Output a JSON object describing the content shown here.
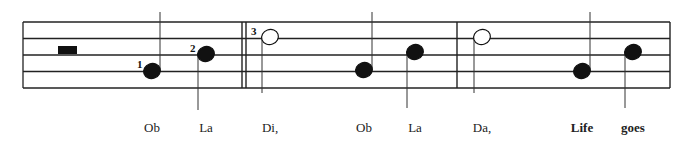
{
  "staff": {
    "lines": 5,
    "top": 22,
    "spacing": 16.5,
    "left": 23,
    "right": 670
  },
  "barlines": [
    {
      "x": 242,
      "double": true
    },
    {
      "x": 457,
      "double": false
    },
    {
      "x": 670,
      "double": false
    }
  ],
  "rest": {
    "type": "half-rest",
    "x": 58,
    "y": 46
  },
  "notes": [
    {
      "x": 152,
      "y": 71,
      "filled": true,
      "stem": "up",
      "marker": "1",
      "lyric": "Ob"
    },
    {
      "x": 206,
      "y": 54,
      "filled": true,
      "stem": "down",
      "marker": "2",
      "lyric": "La"
    },
    {
      "x": 270,
      "y": 37,
      "filled": false,
      "stem": "down",
      "marker": "3",
      "lyric": "Di,"
    },
    {
      "x": 364,
      "y": 70,
      "filled": true,
      "stem": "up",
      "lyric": "Ob"
    },
    {
      "x": 415,
      "y": 52,
      "filled": true,
      "stem": "down",
      "lyric": "La"
    },
    {
      "x": 482,
      "y": 37,
      "filled": false,
      "stem": "down",
      "lyric": "Da,"
    },
    {
      "x": 582,
      "y": 71,
      "filled": true,
      "stem": "up",
      "lyric": "Life",
      "bold": true
    },
    {
      "x": 633,
      "y": 52,
      "filled": true,
      "stem": "down",
      "lyric": "goes",
      "bold": true
    }
  ],
  "markers": [
    {
      "text": "1",
      "x": 137,
      "y": 58
    },
    {
      "text": "2",
      "x": 190,
      "y": 42
    },
    {
      "text": "3",
      "x": 251,
      "y": 25
    }
  ]
}
